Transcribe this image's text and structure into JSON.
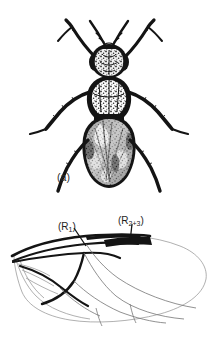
{
  "figure": {
    "background_color": "#ffffff",
    "ink_color": "#141414",
    "vein_line_color": "#8e8e8e",
    "panels": [
      {
        "key": "a",
        "label": "(a)",
        "caption_position": "below-left",
        "subject": "dorsal-view-fly",
        "description": "dorsal habitus of a small fly (dipteran), stipple engraving"
      },
      {
        "key": "b",
        "label": "(b)",
        "caption_position": "lower-left",
        "subject": "wing-venation-diagram",
        "description": "wing venation diagram with thickened anterior radial veins"
      }
    ],
    "annotations": [
      {
        "key": "r1",
        "text": "(R",
        "sub": "1",
        "text_end": ")",
        "target": "radial-vein-r1",
        "leader": true
      },
      {
        "key": "r23",
        "text": "(R",
        "sub": "2+3",
        "text_end": ")",
        "target": "radial-vein-r2plus3",
        "leader": true
      }
    ]
  }
}
